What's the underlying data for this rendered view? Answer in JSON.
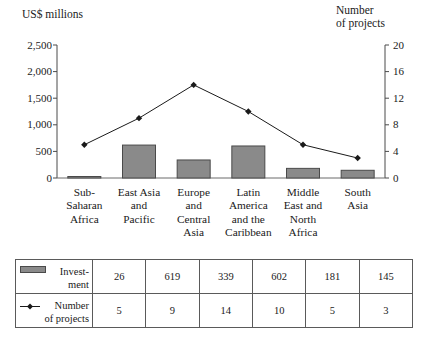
{
  "chart_data": {
    "type": "bar",
    "title": "",
    "categories": [
      "Sub-\nSaharan\nAfrica",
      "East Asia\nand\nPacific",
      "Europe\nand\nCentral\nAsia",
      "Latin\nAmerica\nand the\nCaribbean",
      "Middle\nEast and\nNorth\nAfrica",
      "South\nAsia"
    ],
    "series": [
      {
        "name": "Investment",
        "type": "bar",
        "axis": "left",
        "values": [
          26,
          619,
          339,
          602,
          181,
          145
        ],
        "color": "#8a8a8a"
      },
      {
        "name": "Number of projects",
        "type": "line",
        "axis": "right",
        "values": [
          5,
          9,
          14,
          10,
          5,
          3
        ],
        "color": "#1a1a1a"
      }
    ],
    "xlabel": "",
    "ylabel": "US$ millions",
    "y2label": "Number of projects",
    "ylim": [
      0,
      2500
    ],
    "y2lim": [
      0,
      20
    ],
    "yticks": [
      "0",
      "500",
      "1,000",
      "1,500",
      "2,000",
      "2,500"
    ],
    "ytick_values": [
      0,
      500,
      1000,
      1500,
      2000,
      2500
    ],
    "y2ticks": [
      "0",
      "4",
      "8",
      "12",
      "16",
      "20"
    ],
    "y2tick_values": [
      0,
      4,
      8,
      12,
      16,
      20
    ],
    "grid": false,
    "legend_position": "table-below"
  },
  "axes": {
    "left_title": "US$ millions",
    "right_title": "Number\nof projects"
  },
  "table": {
    "rows": [
      {
        "label": "Invest-\nment",
        "marker": "bar-swatch",
        "values": [
          "26",
          "619",
          "339",
          "602",
          "181",
          "145"
        ]
      },
      {
        "label": "Number\nof projects",
        "marker": "line-marker",
        "values": [
          "5",
          "9",
          "14",
          "10",
          "5",
          "3"
        ]
      }
    ]
  }
}
